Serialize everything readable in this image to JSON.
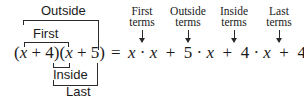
{
  "diagram": {
    "left_expression": "(x + 4)(x + 5)",
    "equals": "=",
    "brackets": {
      "outside": "Outside",
      "first": "First",
      "inside": "Inside",
      "last": "Last"
    },
    "right_terms": [
      {
        "label_line1": "First",
        "label_line2": "terms",
        "term": "x · x"
      },
      {
        "label_line1": "Outside",
        "label_line2": "terms",
        "term": "5 · x"
      },
      {
        "label_line1": "Inside",
        "label_line2": "terms",
        "term": "4 · x"
      },
      {
        "label_line1": "Last",
        "label_line2": "terms",
        "term": "4 · 5"
      }
    ],
    "plus": "+"
  }
}
